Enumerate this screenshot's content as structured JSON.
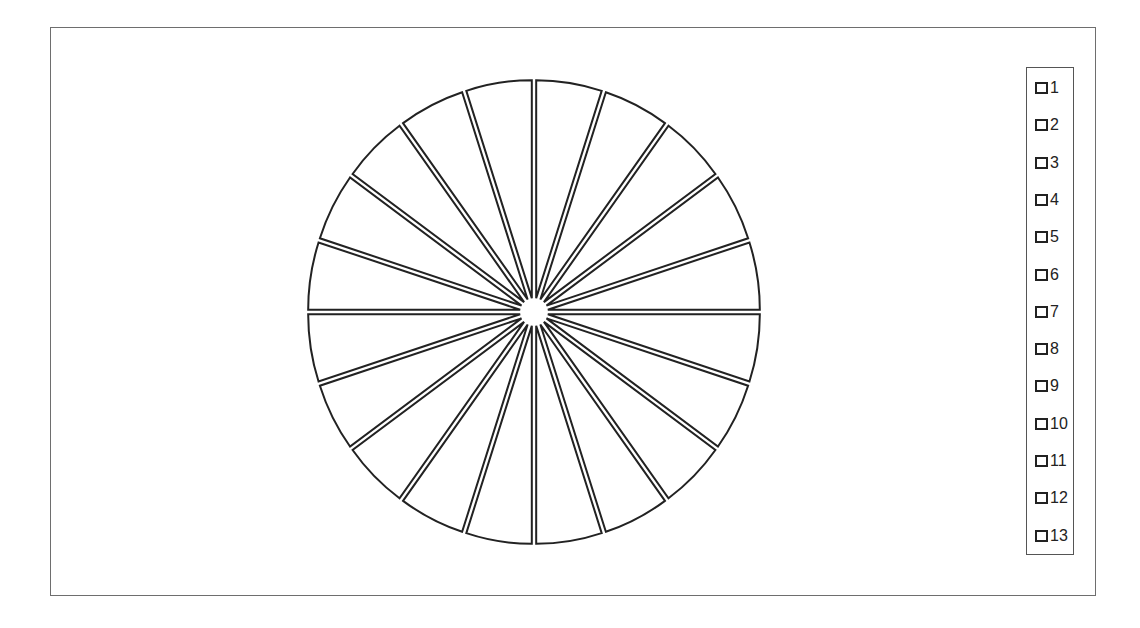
{
  "chart_data": {
    "type": "pie",
    "title": "",
    "variant": "exploded pie, outline only, no fill",
    "slices": 20,
    "values": [
      1,
      1,
      1,
      1,
      1,
      1,
      1,
      1,
      1,
      1,
      1,
      1,
      1,
      1,
      1,
      1,
      1,
      1,
      1,
      1
    ],
    "legend": {
      "position": "right",
      "entries": [
        "1",
        "2",
        "3",
        "4",
        "5",
        "6",
        "7",
        "8",
        "9",
        "10",
        "11",
        "12",
        "13"
      ]
    },
    "colors": {
      "stroke": "#222222",
      "fill": "#ffffff",
      "frame": "#6e6e6e"
    }
  }
}
